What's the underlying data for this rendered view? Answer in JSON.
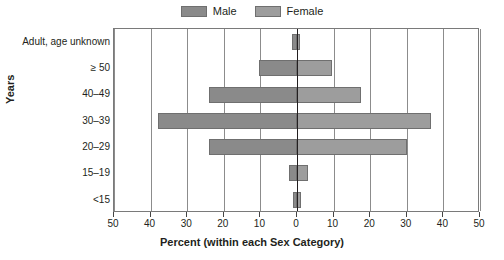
{
  "chart_data": {
    "type": "bar",
    "chart_style": "population-pyramid",
    "title": "",
    "xlabel": "Percent (within each Sex Category)",
    "ylabel": "Years",
    "categories": [
      "Adult, age unknown",
      "≥ 50",
      "40–49",
      "30–39",
      "20–29",
      "15–19",
      "<15"
    ],
    "series": [
      {
        "name": "Male",
        "direction": "left",
        "color": "#8a8a8a",
        "values": [
          1.3,
          10.5,
          24.0,
          38.0,
          24.0,
          2.2,
          1.0
        ]
      },
      {
        "name": "Female",
        "direction": "right",
        "color": "#9d9d9d",
        "values": [
          0.8,
          9.5,
          17.5,
          36.5,
          30.0,
          3.0,
          1.0
        ]
      }
    ],
    "xlim": [
      -50,
      50
    ],
    "xticks": [
      -50,
      -40,
      -30,
      -20,
      -10,
      0,
      10,
      20,
      30,
      40,
      50
    ],
    "xticklabels": [
      "50",
      "40",
      "30",
      "20",
      "10",
      "0",
      "10",
      "20",
      "30",
      "40",
      "50"
    ],
    "grid": true,
    "grid_axis": "x",
    "legend_position": "top-center"
  },
  "legend": {
    "entries": [
      {
        "label": "Male",
        "color": "#8a8a8a"
      },
      {
        "label": "Female",
        "color": "#9d9d9d"
      }
    ]
  },
  "axes": {
    "y_title": "Years",
    "x_title": "Percent (within each Sex Category)"
  },
  "colors": {
    "male": "#8a8a8a",
    "female": "#9d9d9d",
    "grid": "#8c8c8c",
    "axis": "#231f20",
    "frame": "#7a7a7a"
  }
}
